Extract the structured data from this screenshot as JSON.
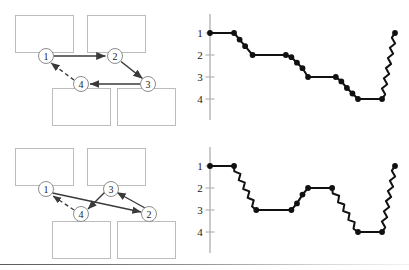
{
  "figure": {
    "background_color": "#ffffff",
    "box_stroke_color": "#b9b9b9",
    "node_stroke_color": "#8d8d8d",
    "arrow_color": "#3a3a3a",
    "chart_color": "#111111",
    "axis_color": "#b0b0b0",
    "footer_rule_color": "#6e6e6e",
    "panels": [
      {
        "name": "top-panel",
        "diagram": {
          "name": "scanpath-diagram-top",
          "boxes": [
            {
              "label": "",
              "x": 15,
              "y": 15,
              "w": 58,
              "h": 37
            },
            {
              "label": "",
              "x": 87,
              "y": 15,
              "w": 58,
              "h": 37
            },
            {
              "label": "",
              "x": 52,
              "y": 88,
              "w": 58,
              "h": 37
            },
            {
              "label": "",
              "x": 117,
              "y": 88,
              "w": 58,
              "h": 37
            }
          ],
          "nodes": [
            {
              "label": "1",
              "cx": 46,
              "cy": 56,
              "r": 7.5
            },
            {
              "label": "2",
              "cx": 115,
              "cy": 56,
              "r": 7.5
            },
            {
              "label": "3",
              "cx": 148,
              "cy": 84,
              "r": 7.5
            },
            {
              "label": "4",
              "cx": 81,
              "cy": 84,
              "r": 7.5
            }
          ],
          "edges": [
            {
              "from": "1",
              "to": "2",
              "style": "solid"
            },
            {
              "from": "2",
              "to": "3",
              "style": "solid"
            },
            {
              "from": "3",
              "to": "4",
              "style": "solid"
            },
            {
              "from": "4",
              "to": "1",
              "style": "dashed"
            }
          ]
        },
        "chart": {
          "name": "fixation-sequence-chart-top",
          "axis_label_values": [
            "1",
            "2",
            "3",
            "4"
          ]
        }
      },
      {
        "name": "bottom-panel",
        "diagram": {
          "name": "scanpath-diagram-bottom",
          "boxes": [
            {
              "label": "",
              "x": 15,
              "y": 148,
              "w": 58,
              "h": 37
            },
            {
              "label": "",
              "x": 87,
              "y": 148,
              "w": 58,
              "h": 37
            },
            {
              "label": "",
              "x": 52,
              "y": 221,
              "w": 58,
              "h": 37
            },
            {
              "label": "",
              "x": 117,
              "y": 221,
              "w": 58,
              "h": 37
            }
          ],
          "nodes": [
            {
              "label": "1",
              "cx": 46,
              "cy": 189,
              "r": 7.5
            },
            {
              "label": "3",
              "cx": 111,
              "cy": 189,
              "r": 7.5
            },
            {
              "label": "4",
              "cx": 81,
              "cy": 214,
              "r": 7.5
            },
            {
              "label": "2",
              "cx": 149,
              "cy": 214,
              "r": 7.5
            }
          ],
          "edges": [
            {
              "from": "1",
              "to": "2",
              "style": "solid"
            },
            {
              "from": "2",
              "to": "3",
              "style": "solid"
            },
            {
              "from": "3",
              "to": "4",
              "style": "solid"
            },
            {
              "from": "4",
              "to": "1",
              "style": "dashed"
            }
          ]
        },
        "chart": {
          "name": "fixation-sequence-chart-bottom",
          "axis_label_values": [
            "1",
            "2",
            "3",
            "4"
          ]
        }
      }
    ]
  },
  "chart_data": [
    {
      "type": "line",
      "name": "fixation-sequence-chart-top",
      "title": "",
      "xlabel": "",
      "ylabel": "",
      "ylim": [
        1,
        4
      ],
      "yticks": [
        1,
        2,
        3,
        4
      ],
      "ytick_labels": [
        "1",
        "2",
        "3",
        "4"
      ],
      "grid": false,
      "legend": "none",
      "y_axis_inverted": true,
      "marker": "filled-circle",
      "note": "Step plot of region index over time; transitions drawn as wavy saccade traces between dwell plateaus.",
      "points": [
        {
          "x": 0.0,
          "y": 1.0,
          "marker": true
        },
        {
          "x": 0.13,
          "y": 1.0,
          "marker": true
        },
        {
          "x": 0.16,
          "y": 1.3,
          "marker": true
        },
        {
          "x": 0.19,
          "y": 1.6,
          "marker": true
        },
        {
          "x": 0.23,
          "y": 2.0,
          "marker": true
        },
        {
          "x": 0.41,
          "y": 2.0,
          "marker": true
        },
        {
          "x": 0.44,
          "y": 2.1,
          "marker": true
        },
        {
          "x": 0.47,
          "y": 2.35,
          "marker": true
        },
        {
          "x": 0.5,
          "y": 2.6,
          "marker": true
        },
        {
          "x": 0.53,
          "y": 3.0,
          "marker": true
        },
        {
          "x": 0.68,
          "y": 3.0,
          "marker": true
        },
        {
          "x": 0.71,
          "y": 3.2,
          "marker": true
        },
        {
          "x": 0.74,
          "y": 3.5,
          "marker": true
        },
        {
          "x": 0.77,
          "y": 3.75,
          "marker": true
        },
        {
          "x": 0.8,
          "y": 4.0,
          "marker": true
        },
        {
          "x": 0.93,
          "y": 4.0,
          "marker": true
        },
        {
          "x": 1.0,
          "y": 1.0,
          "marker": true
        }
      ],
      "wavy_segments": [
        {
          "from_x": 0.93,
          "to_x": 1.0,
          "from_y": 4.0,
          "to_y": 1.0
        }
      ]
    },
    {
      "type": "line",
      "name": "fixation-sequence-chart-bottom",
      "title": "",
      "xlabel": "",
      "ylabel": "",
      "ylim": [
        1,
        4
      ],
      "yticks": [
        1,
        2,
        3,
        4
      ],
      "ytick_labels": [
        "1",
        "2",
        "3",
        "4"
      ],
      "grid": false,
      "legend": "none",
      "y_axis_inverted": true,
      "marker": "filled-circle",
      "note": "Step plot of region index over time; transitions drawn as wavy saccade traces between dwell plateaus.",
      "points": [
        {
          "x": 0.0,
          "y": 1.0,
          "marker": true
        },
        {
          "x": 0.13,
          "y": 1.0,
          "marker": true
        },
        {
          "x": 0.25,
          "y": 3.0,
          "marker": true
        },
        {
          "x": 0.44,
          "y": 3.0,
          "marker": true
        },
        {
          "x": 0.47,
          "y": 2.7,
          "marker": true
        },
        {
          "x": 0.5,
          "y": 2.3,
          "marker": true
        },
        {
          "x": 0.53,
          "y": 2.0,
          "marker": true
        },
        {
          "x": 0.66,
          "y": 2.0,
          "marker": true
        },
        {
          "x": 0.8,
          "y": 4.0,
          "marker": true
        },
        {
          "x": 0.93,
          "y": 4.0,
          "marker": true
        },
        {
          "x": 1.0,
          "y": 1.0,
          "marker": true
        }
      ],
      "wavy_segments": [
        {
          "from_x": 0.13,
          "to_x": 0.25,
          "from_y": 1.0,
          "to_y": 3.0
        },
        {
          "from_x": 0.66,
          "to_x": 0.8,
          "from_y": 2.0,
          "to_y": 4.0
        },
        {
          "from_x": 0.93,
          "to_x": 1.0,
          "from_y": 4.0,
          "to_y": 1.0
        }
      ]
    }
  ]
}
